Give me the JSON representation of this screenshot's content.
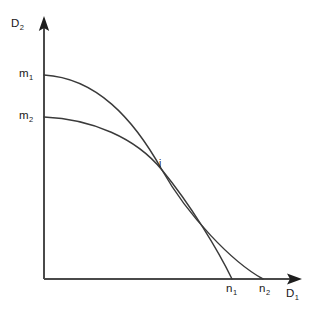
{
  "figure": {
    "type": "line-diagram",
    "background_color": "#ffffff",
    "line_color": "#3a3a3a",
    "axis_color": "#4a4a4a",
    "text_color": "#181818"
  },
  "axes": {
    "y_axis": {
      "label": "D",
      "label_subscript": "2",
      "name": "vertical-axis",
      "origin": [
        44,
        279
      ],
      "tip": [
        44,
        18
      ],
      "arrow": "up"
    },
    "x_axis": {
      "label": "D",
      "label_subscript": "1",
      "name": "horizontal-axis",
      "origin": [
        44,
        279
      ],
      "tip": [
        300,
        279
      ],
      "arrow": "right"
    }
  },
  "labels": {
    "m1": {
      "text": "m",
      "subscript": "1"
    },
    "m2": {
      "text": "m",
      "subscript": "2"
    },
    "n1": {
      "text": "n",
      "subscript": "1"
    },
    "n2": {
      "text": "n",
      "subscript": "2"
    },
    "intersection": {
      "text": "i"
    }
  },
  "chart_data": {
    "type": "line",
    "title": "",
    "xlabel": "D1",
    "ylabel": "D2",
    "grid": false,
    "legend": null,
    "axis_origin_px": [
      44,
      279
    ],
    "x_axis_tip_px": [
      300,
      279
    ],
    "y_axis_tip_px": [
      44,
      18
    ],
    "annotations": [
      {
        "text": "m1",
        "at_px": [
          44,
          75
        ],
        "describes": "y-intercept of curve 1"
      },
      {
        "text": "m2",
        "at_px": [
          44,
          117
        ],
        "describes": "y-intercept of curve 2"
      },
      {
        "text": "n1",
        "at_px": [
          232,
          279
        ],
        "describes": "x-intercept of curve 2"
      },
      {
        "text": "n2",
        "at_px": [
          263,
          279
        ],
        "describes": "x-intercept of curve 1"
      },
      {
        "text": "i",
        "at_px": [
          162,
          170
        ],
        "describes": "intersection of curve 1 and curve 2"
      }
    ],
    "series": [
      {
        "name": "curve-m1-n2",
        "start_px": [
          44,
          75
        ],
        "end_px": [
          263,
          279
        ],
        "intersection_px": [
          162,
          170
        ],
        "shape": "concave",
        "path": "M 44 75 C 96 78 133 118 162 170 C 188 216 232 262 263 279"
      },
      {
        "name": "curve-m2-n1",
        "start_px": [
          44,
          117
        ],
        "end_px": [
          232,
          279
        ],
        "intersection_px": [
          162,
          170
        ],
        "shape": "concave",
        "path": "M 44 117 C 92 119 136 138 162 170 C 190 204 218 250 232 279"
      }
    ]
  }
}
